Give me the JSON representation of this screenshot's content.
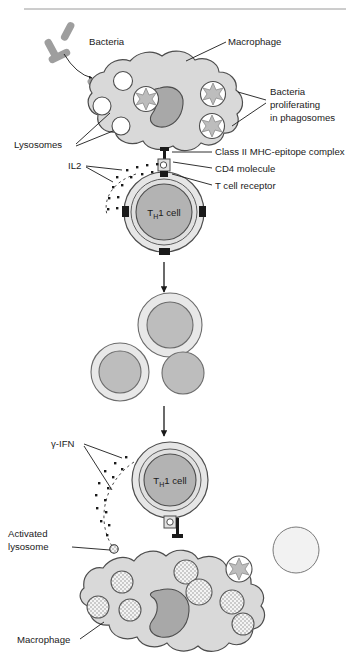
{
  "figure": {
    "title": "",
    "domain": "immunology-cell-diagram",
    "background_color": "#ffffff",
    "top_rule": true
  },
  "palette": {
    "cell_fill": "#d9d9d9",
    "cell_stroke": "#4d4d4d",
    "nucleus_fill": "#a8a8a8",
    "nucleus_stroke": "#4d4d4d",
    "vesicle_fill": "#ffffff",
    "vesicle_stroke": "#4d4d4d",
    "bacteria_fill": "#9e9e9e",
    "bacteria_stroke": "#8a8a8a",
    "tcell_outer_fill": "#e6e6e6",
    "tcell_inner_fill": "#b3b3b3",
    "receptor_fill": "#1a1a1a",
    "cytokine_dot": "#1a1a1a",
    "arrow": "#1a1a1a",
    "granule_fill": "#f2f2f2",
    "text": "#1a1a1a"
  },
  "labels": {
    "bacteria": "Bacteria",
    "macrophage_top": "Macrophage",
    "bacteria_proliferating_l1": "Bacteria",
    "bacteria_proliferating_l2": "proliferating",
    "bacteria_proliferating_l3": "in phagosomes",
    "lysosomes": "Lysosomes",
    "il2": "IL2",
    "mhc_complex": "Class II MHC-epitope complex",
    "cd4_molecule": "CD4 molecule",
    "t_cell_receptor": "T cell receptor",
    "gamma_ifn": "γ-IFN",
    "activated_lysosome_l1": "Activated",
    "activated_lysosome_l2": "lysosome",
    "macrophage_bottom": "Macrophage"
  },
  "cell_text": {
    "th1_base": "T",
    "th1_sub": "H",
    "th1_tail": "1 cell"
  },
  "stages": {
    "stage1": {
      "name": "antigen-presentation",
      "macrophage_vesicles": 3,
      "phagosome_bacteria": 3,
      "free_bacteria": 3,
      "il2_dots": 14
    },
    "stage2": {
      "name": "clonal-proliferation",
      "daughter_cells": 3
    },
    "stage3": {
      "name": "macrophage-activation",
      "ifn_dots": 13,
      "activated_lysosomes": 7
    }
  }
}
